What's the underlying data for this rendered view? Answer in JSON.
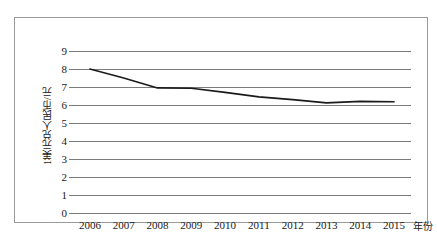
{
  "chart_data": {
    "type": "line",
    "title": "",
    "xlabel": "年份",
    "ylabel": "1美元兑人民币/元",
    "x": [
      2006,
      2007,
      2008,
      2009,
      2010,
      2011,
      2012,
      2013,
      2014,
      2015
    ],
    "xtick_labels": [
      "2006",
      "2007",
      "2008",
      "2009",
      "2010",
      "2011",
      "2012",
      "2013",
      "2014",
      "2015"
    ],
    "ytick_labels": [
      "0",
      "1",
      "2",
      "3",
      "4",
      "5",
      "6",
      "7",
      "8",
      "9"
    ],
    "ytick_values": [
      0,
      1,
      2,
      3,
      4,
      5,
      6,
      7,
      8,
      9
    ],
    "ylim": [
      0,
      9
    ],
    "values": [
      8.0,
      7.5,
      6.95,
      6.93,
      6.7,
      6.45,
      6.3,
      6.12,
      6.2,
      6.18
    ],
    "series": [
      {
        "name": "1美元兑人民币/元",
        "values": [
          8.0,
          7.5,
          6.95,
          6.93,
          6.7,
          6.45,
          6.3,
          6.12,
          6.2,
          6.18
        ],
        "color": "#1a1a1a"
      }
    ],
    "grid": true,
    "grid_axis": "y",
    "legend": false,
    "legend_position": "none",
    "line_color": "#1a1a1a",
    "grid_color": "#7b7b7b",
    "frame_color": "#9a9a9a",
    "background": "#ffffff"
  }
}
